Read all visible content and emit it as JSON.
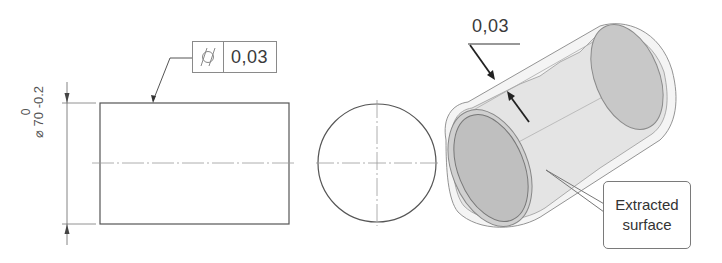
{
  "figure": {
    "type": "cylindricity-tolerance-drawing",
    "colors": {
      "line": "#555555",
      "centerline": "#999999",
      "surface_fill": "#e3e3e3",
      "end_face_fill": "#bdbdbd",
      "arrow": "#222222"
    }
  },
  "front_view": {
    "feature_control_frame": {
      "symbol": "cylindricity-icon",
      "tolerance": "0,03"
    },
    "diameter_dimension": {
      "symbol": "⌀",
      "nominal": "70",
      "lower_deviation": "-0.2",
      "upper_deviation": "0"
    }
  },
  "side_view": {
    "shape": "circle-with-centerlines"
  },
  "isometric_view": {
    "tolerance_zone_width": "0,03",
    "callout": {
      "line1": "Extracted",
      "line2": "surface"
    }
  }
}
